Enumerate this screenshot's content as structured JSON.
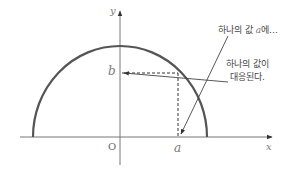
{
  "diagram": {
    "type": "function-mapping-semicircle",
    "colors": {
      "curve": "#555555",
      "axis": "#777777",
      "dashed": "#333333",
      "pointer": "#444444",
      "text": "#444444"
    },
    "axes": {
      "x_label": "x",
      "y_label": "y",
      "origin_label": "O"
    },
    "points": {
      "a_label": "a",
      "b_label": "b"
    },
    "annotations": {
      "input_note_prefix": "하나의 값 ",
      "input_note_var": "a",
      "input_note_suffix": "에…",
      "output_note_line1": "하나의 값이",
      "output_note_line2": "대응된다."
    }
  }
}
